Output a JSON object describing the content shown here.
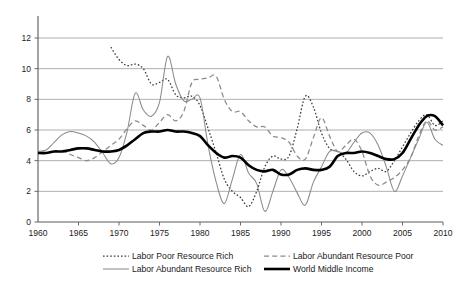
{
  "chart_data": {
    "type": "line",
    "title": "",
    "xlabel": "",
    "ylabel": "",
    "xlim": [
      1960,
      2010
    ],
    "ylim": [
      0,
      12
    ],
    "x_ticks": [
      1960,
      1965,
      1970,
      1975,
      1980,
      1985,
      1990,
      1995,
      2000,
      2005,
      2010
    ],
    "y_ticks": [
      0,
      2,
      4,
      6,
      8,
      10,
      12
    ],
    "grid": "horizontal",
    "legend_position": "bottom",
    "series": [
      {
        "name": "Labor Poor Resource Rich",
        "style": "dotted",
        "color": "#3a3a3a",
        "x": [
          1969,
          1970,
          1971,
          1972,
          1973,
          1974,
          1975,
          1976,
          1977,
          1978,
          1979,
          1980,
          1981,
          1982,
          1983,
          1984,
          1985,
          1986,
          1987,
          1988,
          1989,
          1990,
          1991,
          1992,
          1993,
          1994,
          1995,
          1996,
          1997,
          1998,
          1999,
          2000,
          2001,
          2002,
          2003,
          2004,
          2005,
          2006,
          2007,
          2008,
          2009,
          2010
        ],
        "values": [
          11.4,
          10.6,
          10.2,
          10.3,
          10.0,
          9.0,
          9.1,
          9.3,
          8.3,
          8.1,
          8.2,
          7.6,
          6.1,
          4.5,
          2.8,
          2.0,
          1.6,
          1.0,
          2.0,
          3.6,
          4.3,
          4.1,
          4.3,
          6.1,
          8.2,
          7.5,
          5.8,
          4.8,
          4.6,
          4.1,
          3.3,
          3.0,
          3.3,
          3.5,
          3.3,
          4.0,
          4.9,
          5.8,
          6.6,
          7.0,
          6.3,
          6.6
        ]
      },
      {
        "name": "Labor Abundant Resource Poor",
        "style": "dashed",
        "color": "#8a8a8a",
        "x": [
          1963,
          1964,
          1965,
          1966,
          1967,
          1968,
          1969,
          1970,
          1971,
          1972,
          1973,
          1974,
          1975,
          1976,
          1977,
          1978,
          1979,
          1980,
          1981,
          1982,
          1983,
          1984,
          1985,
          1986,
          1987,
          1988,
          1989,
          1990,
          1991,
          1992,
          1993,
          1994,
          1995,
          1996,
          1997,
          1998,
          1999,
          2000,
          2001,
          2002,
          2003,
          2004,
          2005,
          2006,
          2007,
          2008,
          2009,
          2010
        ],
        "values": [
          4.7,
          4.4,
          4.2,
          4.0,
          4.2,
          4.6,
          5.0,
          5.4,
          6.1,
          6.6,
          6.3,
          6.0,
          6.5,
          7.0,
          6.6,
          7.2,
          9.1,
          9.3,
          9.4,
          9.5,
          8.0,
          7.2,
          7.2,
          6.6,
          6.2,
          6.2,
          5.6,
          5.5,
          5.2,
          4.3,
          4.1,
          5.5,
          6.8,
          5.6,
          4.6,
          5.0,
          5.4,
          4.6,
          3.0,
          2.4,
          2.6,
          2.9,
          3.4,
          4.2,
          5.6,
          6.6,
          6.0,
          6.2
        ]
      },
      {
        "name": "Labor Abundant Resource Rich",
        "style": "thin-solid",
        "color": "#8a8a8a",
        "x": [
          1960,
          1961,
          1962,
          1963,
          1964,
          1965,
          1966,
          1967,
          1968,
          1969,
          1970,
          1971,
          1972,
          1973,
          1974,
          1975,
          1976,
          1977,
          1978,
          1979,
          1980,
          1981,
          1982,
          1983,
          1984,
          1985,
          1986,
          1987,
          1988,
          1989,
          1990,
          1991,
          1992,
          1993,
          1994,
          1995,
          1996,
          1997,
          1998,
          1999,
          2000,
          2001,
          2002,
          2003,
          2004,
          2005,
          2006,
          2007,
          2008,
          2009,
          2010
        ],
        "values": [
          4.6,
          4.7,
          5.2,
          5.7,
          5.9,
          5.8,
          5.6,
          5.2,
          4.5,
          3.8,
          4.2,
          5.9,
          8.4,
          7.3,
          6.9,
          7.8,
          10.8,
          9.0,
          7.9,
          8.0,
          8.1,
          5.0,
          2.6,
          1.2,
          2.8,
          4.4,
          3.2,
          2.5,
          0.7,
          2.0,
          3.4,
          2.9,
          1.9,
          1.1,
          2.6,
          3.6,
          4.6,
          4.6,
          4.5,
          5.2,
          5.8,
          5.8,
          5.0,
          3.6,
          2.0,
          3.0,
          4.2,
          5.4,
          6.5,
          5.4,
          5.0
        ]
      },
      {
        "name": "World Middle Income",
        "style": "thick-solid",
        "color": "#000000",
        "x": [
          1960,
          1961,
          1962,
          1963,
          1964,
          1965,
          1966,
          1967,
          1968,
          1969,
          1970,
          1971,
          1972,
          1973,
          1974,
          1975,
          1976,
          1977,
          1978,
          1979,
          1980,
          1981,
          1982,
          1983,
          1984,
          1985,
          1986,
          1987,
          1988,
          1989,
          1990,
          1991,
          1992,
          1993,
          1994,
          1995,
          1996,
          1997,
          1998,
          1999,
          2000,
          2001,
          2002,
          2003,
          2004,
          2005,
          2006,
          2007,
          2008,
          2009,
          2010
        ],
        "values": [
          4.5,
          4.5,
          4.6,
          4.6,
          4.7,
          4.8,
          4.8,
          4.7,
          4.6,
          4.6,
          4.7,
          5.0,
          5.4,
          5.8,
          5.9,
          5.9,
          6.0,
          5.9,
          5.9,
          5.8,
          5.6,
          5.0,
          4.5,
          4.2,
          4.3,
          4.2,
          3.7,
          3.4,
          3.3,
          3.4,
          3.1,
          3.1,
          3.4,
          3.5,
          3.4,
          3.4,
          3.6,
          4.3,
          4.5,
          4.5,
          4.6,
          4.5,
          4.3,
          4.1,
          4.1,
          4.5,
          5.4,
          6.3,
          6.9,
          6.9,
          6.3
        ]
      }
    ]
  },
  "legend": {
    "items": [
      {
        "label": "Labor Poor Resource Rich",
        "style": "dotted"
      },
      {
        "label": "Labor Abundant Resource Poor",
        "style": "dashed"
      },
      {
        "label": "Labor Abundant Resource Rich",
        "style": "thin-solid"
      },
      {
        "label": "World Middle Income",
        "style": "thick-solid"
      }
    ]
  },
  "axes": {
    "x_tick_labels": [
      "1960",
      "1965",
      "1970",
      "1975",
      "1980",
      "1985",
      "1990",
      "1995",
      "2000",
      "2005",
      "2010"
    ],
    "y_tick_labels": [
      "0",
      "2",
      "4",
      "6",
      "8",
      "10",
      "12"
    ]
  }
}
